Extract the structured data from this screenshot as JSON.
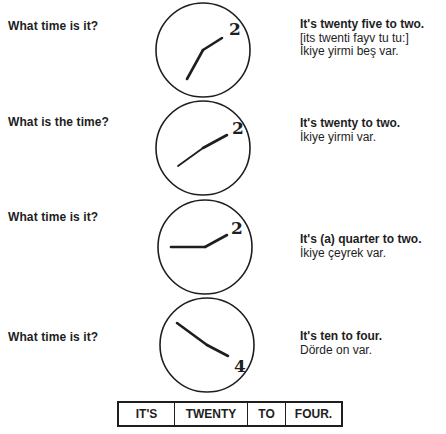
{
  "rows": [
    {
      "question": "What time is it?",
      "clock": {
        "hour": 1,
        "minute": 35,
        "numeral": "2"
      },
      "answer_en": "It's twenty five to two.",
      "pronunciation": "[its twenti fayv tu tu:]",
      "answer_tr": "İkiye yirmi beş var."
    },
    {
      "question": "What is the time?",
      "clock": {
        "hour": 1,
        "minute": 40,
        "numeral": "2"
      },
      "answer_en": "It's twenty to two.",
      "answer_tr": "İkiye yirmi var."
    },
    {
      "question": "What time is it?",
      "clock": {
        "hour": 1,
        "minute": 45,
        "numeral": "2"
      },
      "answer_en": "It's (a) quarter to two.",
      "answer_tr": "İkiye çeyrek var."
    },
    {
      "question": "What time is it?",
      "clock": {
        "hour": 3,
        "minute": 50,
        "numeral": "4"
      },
      "answer_en": "It's ten to four.",
      "answer_tr": "Dörde on var."
    }
  ],
  "sentence_table": [
    "IT'S",
    "TWENTY",
    "TO",
    "FOUR."
  ]
}
